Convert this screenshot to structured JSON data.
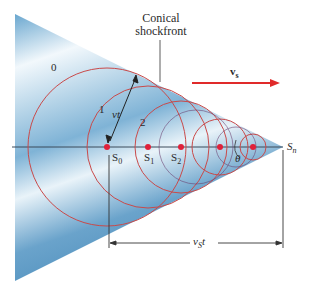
{
  "diagram": {
    "title_line1": "Conical",
    "title_line2": "shockfront",
    "velocity_label": "v",
    "velocity_sub": "s",
    "wavefront_labels": [
      "0",
      "1",
      "2"
    ],
    "radius_label": "vt",
    "theta_label": "θ",
    "source_labels": [
      {
        "main": "S",
        "sub": "0"
      },
      {
        "main": "S",
        "sub": "1"
      },
      {
        "main": "S",
        "sub": "2"
      }
    ],
    "end_label": {
      "main": "S",
      "sub": "n"
    },
    "distance_label": {
      "main": "v",
      "sub": "S",
      "tail": "t"
    },
    "colors": {
      "circle": "#c94a4a",
      "dot": "#e0213a",
      "arrow": "#e02a2a",
      "cone_dark": "#5b9cc6",
      "cone_light": "#dcebf5",
      "axis": "#3a4a5a"
    }
  }
}
